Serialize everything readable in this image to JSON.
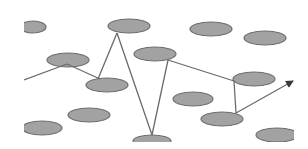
{
  "diagram": {
    "type": "network-path",
    "background": "#ffffff",
    "colors": {
      "node_fill": "#a2a2a2",
      "node_stroke": "#6e6e6e",
      "edge": "#6a6a6a"
    },
    "clip": {
      "x": 24,
      "y": 0,
      "width": 270,
      "height": 142
    },
    "nodes": [
      {
        "id": "n1",
        "cx": 33,
        "cy": 27,
        "rx": 13,
        "ry": 6
      },
      {
        "id": "n2",
        "cx": 68,
        "cy": 60,
        "rx": 21,
        "ry": 7
      },
      {
        "id": "n3",
        "cx": 129,
        "cy": 26,
        "rx": 21,
        "ry": 7
      },
      {
        "id": "n4",
        "cx": 155,
        "cy": 54,
        "rx": 21,
        "ry": 7
      },
      {
        "id": "n5",
        "cx": 211,
        "cy": 29,
        "rx": 21,
        "ry": 7
      },
      {
        "id": "n6",
        "cx": 265,
        "cy": 38,
        "rx": 21,
        "ry": 7
      },
      {
        "id": "n7",
        "cx": 107,
        "cy": 85,
        "rx": 21,
        "ry": 7
      },
      {
        "id": "n8",
        "cx": 254,
        "cy": 79,
        "rx": 21,
        "ry": 7
      },
      {
        "id": "n9",
        "cx": 193,
        "cy": 99,
        "rx": 20,
        "ry": 7
      },
      {
        "id": "n10",
        "cx": 89,
        "cy": 115,
        "rx": 21,
        "ry": 7
      },
      {
        "id": "n11",
        "cx": 42,
        "cy": 128,
        "rx": 20,
        "ry": 7
      },
      {
        "id": "n12",
        "cx": 152,
        "cy": 141,
        "rx": 19,
        "ry": 6
      },
      {
        "id": "n13",
        "cx": 222,
        "cy": 119,
        "rx": 21,
        "ry": 7
      },
      {
        "id": "n14",
        "cx": 277,
        "cy": 135,
        "rx": 21,
        "ry": 7
      }
    ],
    "edges": [
      {
        "from": "start",
        "x1": 24,
        "y1": 80,
        "x2": 67,
        "y2": 64
      },
      {
        "from": "n2",
        "to": "n7",
        "x1": 67,
        "y1": 64,
        "x2": 100,
        "y2": 79
      },
      {
        "from": "n7",
        "to": "n3",
        "x1": 98,
        "y1": 79,
        "x2": 117,
        "y2": 33
      },
      {
        "from": "n3",
        "to": "n12",
        "x1": 117,
        "y1": 33,
        "x2": 152,
        "y2": 135
      },
      {
        "from": "n12",
        "to": "n4",
        "x1": 152,
        "y1": 135,
        "x2": 168,
        "y2": 60
      },
      {
        "from": "n4",
        "to": "n8",
        "x1": 168,
        "y1": 60,
        "x2": 234,
        "y2": 81
      },
      {
        "from": "n8",
        "to": "n13",
        "x1": 234,
        "y1": 81,
        "x2": 236,
        "y2": 113
      }
    ],
    "arrow": {
      "from": "n13",
      "x1": 236,
      "y1": 113,
      "x2": 293,
      "y2": 81
    }
  }
}
